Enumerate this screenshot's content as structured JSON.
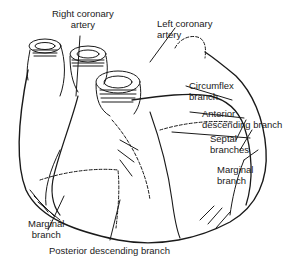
{
  "diagram": {
    "labels": {
      "right_coronary": {
        "line1": "Right coronary",
        "line2": "artery"
      },
      "left_coronary": {
        "line1": "Left coronary",
        "line2": "artery"
      },
      "circumflex": {
        "line1": "Circumflex",
        "line2": "branch"
      },
      "anterior_desc": {
        "line1": "Anterior",
        "line2": "descending branch"
      },
      "septal": {
        "line1": "Septal",
        "line2": "branches"
      },
      "marginal_right": {
        "line1": "Marginal",
        "line2": "branch"
      },
      "marginal_left": {
        "line1": "Marginal",
        "line2": "branch"
      },
      "posterior_desc": {
        "line1": "Posterior descending branch"
      }
    },
    "colors": {
      "ink": "#1a1a1a",
      "background": "#ffffff"
    }
  }
}
